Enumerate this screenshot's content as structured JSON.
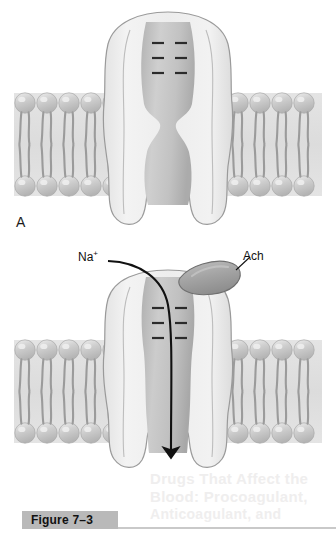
{
  "figure": {
    "caption_label": "Figure 7–3",
    "panels": [
      {
        "letter": "A",
        "state": "closed"
      },
      {
        "letter": "B",
        "state": "open"
      }
    ],
    "labels": {
      "sodium_ion": "Na",
      "sodium_ion_charge": "+",
      "acetylcholine": "Ach"
    },
    "bleed_through_text": [
      "Drugs That Affect the",
      "Blood: Procoagulant,",
      "Anticoagulant, and"
    ],
    "colors": {
      "page_background": "#ffffff",
      "membrane_field": "#dedede",
      "phospholipid_head": "#c6c6c6",
      "phospholipid_head_highlight": "#eaeaea",
      "phospholipid_tail": "#9b9b9b",
      "protein_body_light": "#efefef",
      "protein_body_mid": "#d8d8d8",
      "protein_outline": "#9a9a9a",
      "pore_interior": "#c3c3c3",
      "ligand_fill": "#a9a9a9",
      "ligand_outline": "#6f6f6f",
      "charge_mark": "#2b2b2b",
      "arrow": "#111111",
      "caption_bar": "#b9b9b9",
      "caption_text": "#111111",
      "bleed_text": "#efeeee"
    },
    "channel": {
      "negative_charge_marks": {
        "symbol": "−",
        "rows": 3,
        "columns": 2,
        "total": 6,
        "description": "negative charges lining the channel vestibule"
      },
      "phospholipid_count_left": 5,
      "phospholipid_count_right": 4,
      "bilayer_leaflets": 2
    }
  }
}
